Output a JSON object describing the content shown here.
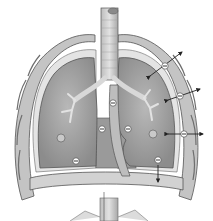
{
  "diagram": {
    "colors": {
      "background": "#ffffff",
      "lung_fill": "#a9a9a9",
      "lung_shade": "#8f8f8f",
      "pleura_fill": "#d4d4d4",
      "chest_wall": "#c8c8c8",
      "rib_dark": "#6e6e6e",
      "trachea": "#cfcfcf",
      "outline": "#555555",
      "arrow": "#222222",
      "pressure_marker_fill": "#ffffff"
    },
    "pressure_markers": [
      {
        "id": "m1",
        "symbol": "−",
        "x": 165,
        "y": 66
      },
      {
        "id": "m2",
        "symbol": "−",
        "x": 180,
        "y": 96
      },
      {
        "id": "m3",
        "symbol": "−",
        "x": 113,
        "y": 103
      },
      {
        "id": "m4",
        "symbol": "−",
        "x": 102,
        "y": 129
      },
      {
        "id": "m5",
        "symbol": "−",
        "x": 128,
        "y": 129
      },
      {
        "id": "m6",
        "symbol": "−",
        "x": 184,
        "y": 134
      },
      {
        "id": "m7",
        "symbol": "−",
        "x": 76,
        "y": 161
      },
      {
        "id": "m8",
        "symbol": "−",
        "x": 158,
        "y": 160
      }
    ],
    "arrows": [
      {
        "id": "a1",
        "type": "double",
        "x1": 150,
        "y1": 76,
        "x2": 182,
        "y2": 52
      },
      {
        "id": "a2",
        "type": "double",
        "x1": 168,
        "y1": 100,
        "x2": 200,
        "y2": 89
      },
      {
        "id": "a3",
        "type": "double",
        "x1": 168,
        "y1": 134,
        "x2": 203,
        "y2": 134
      },
      {
        "id": "a4",
        "type": "single",
        "x1": 158,
        "y1": 165,
        "x2": 158,
        "y2": 182
      }
    ]
  }
}
